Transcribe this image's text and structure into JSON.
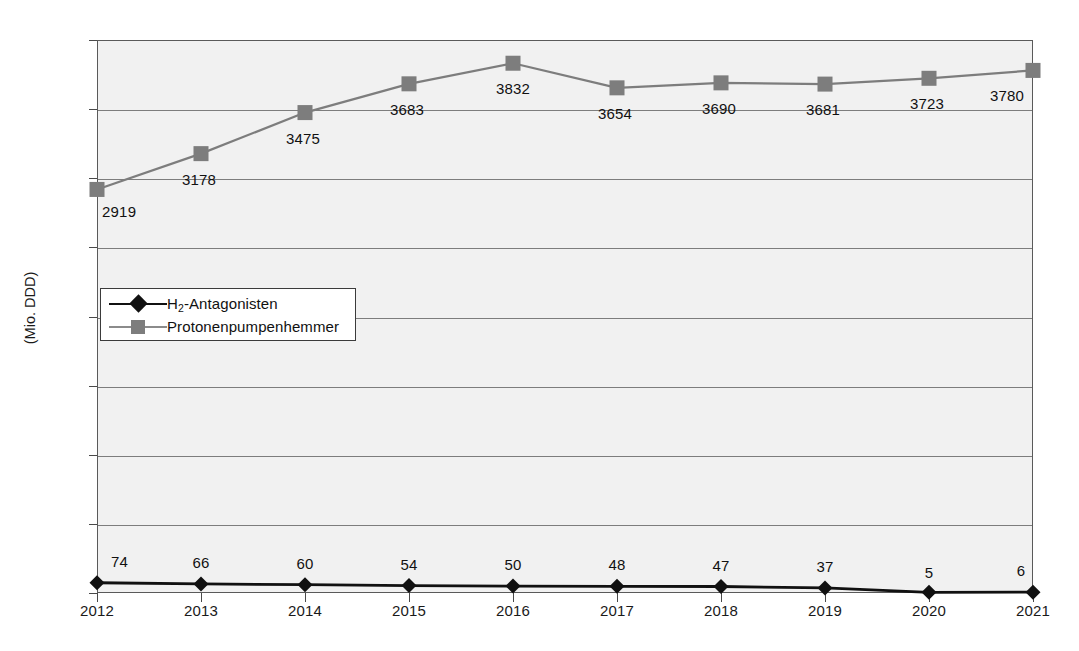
{
  "chart_data": {
    "type": "line",
    "title": "",
    "xlabel": "",
    "ylabel": "(Mio. DDD)",
    "categories": [
      "2012",
      "2013",
      "2014",
      "2015",
      "2016",
      "2017",
      "2018",
      "2019",
      "2020",
      "2021"
    ],
    "ylim": [
      0,
      4000
    ],
    "yticks": [
      "0",
      "500",
      "1000",
      "1500",
      "2000",
      "2500",
      "3000",
      "3500",
      "4000"
    ],
    "ytick_values": [
      0,
      500,
      1000,
      1500,
      2000,
      2500,
      3000,
      3500,
      4000
    ],
    "grid": true,
    "legend_position": "inside-left-middle",
    "series": [
      {
        "name": "H2-Antagonisten",
        "name_display": "H",
        "name_sub": "2",
        "name_rest": "-Antagonisten",
        "color": "#111111",
        "marker": "diamond",
        "values": [
          74,
          66,
          60,
          54,
          50,
          48,
          47,
          37,
          5,
          6
        ],
        "labels": [
          "74",
          "66",
          "60",
          "54",
          "50",
          "48",
          "47",
          "37",
          "5",
          "6"
        ]
      },
      {
        "name": "Protonenpumpenhemmer",
        "color": "#7d7d7d",
        "marker": "square",
        "values": [
          2919,
          3178,
          3475,
          3683,
          3832,
          3654,
          3690,
          3681,
          3723,
          3780
        ],
        "labels": [
          "2919",
          "3178",
          "3475",
          "3683",
          "3832",
          "3654",
          "3690",
          "3681",
          "3723",
          "3780"
        ]
      }
    ]
  },
  "colors": {
    "plot_background": "#f1f1f1",
    "grid": "#7d7d7d",
    "frame": "#5a5a5a",
    "series_h2": "#111111",
    "series_ppi": "#7d7d7d",
    "text": "#111111",
    "page_background": "#ffffff"
  },
  "legend": {
    "items": [
      {
        "label_html": "H2-Antagonisten",
        "marker": "diamond",
        "color": "#111111"
      },
      {
        "label_html": "Protonenpumpenhemmer",
        "marker": "square",
        "color": "#7d7d7d"
      }
    ]
  }
}
